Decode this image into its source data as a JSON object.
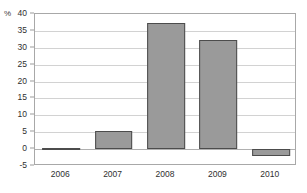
{
  "chart_data": {
    "type": "bar",
    "title": "",
    "xlabel": "",
    "ylabel": "%",
    "categories": [
      "2006",
      "2007",
      "2008",
      "2009",
      "2010"
    ],
    "values": [
      0.2,
      5.4,
      37.3,
      32.2,
      -2.0
    ],
    "ylim": [
      -5,
      40
    ],
    "ytick_labels": [
      "40",
      "35",
      "30",
      "25",
      "20",
      "15",
      "10",
      "5",
      "0",
      "-5"
    ],
    "ytick_values": [
      40,
      35,
      30,
      25,
      20,
      15,
      10,
      5,
      0,
      -5
    ],
    "grid": true,
    "legend": false,
    "bar_color": "#9a9a9a",
    "bar_border_color": "#4c4c4c",
    "gridline_color": "#d2d2d2",
    "frame_color": "#a8a8a8",
    "background_color": "#ffffff"
  }
}
